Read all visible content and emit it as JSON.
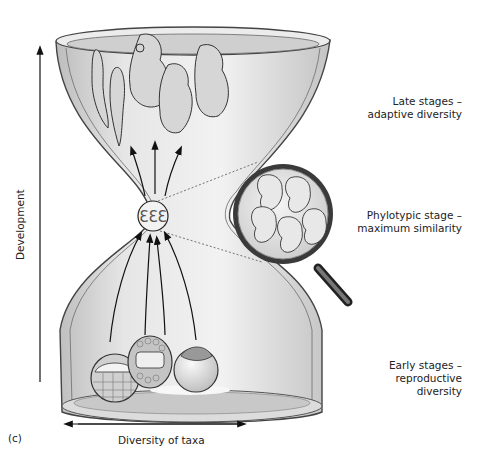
{
  "figure": {
    "panel_label": "(c)",
    "y_axis_label": "Development",
    "x_axis_label": "Diversity of taxa"
  },
  "stages": [
    {
      "line1": "Late stages –",
      "line2": "adaptive diversity"
    },
    {
      "line1": "Phylotypic stage –",
      "line2": "maximum similarity"
    },
    {
      "line1": "Early stages –",
      "line2": "reproductive diversity"
    }
  ],
  "colors": {
    "glass_fill": "#d9d9d9",
    "glass_edge": "#444444",
    "ink": "#222222",
    "background": "#ffffff"
  }
}
